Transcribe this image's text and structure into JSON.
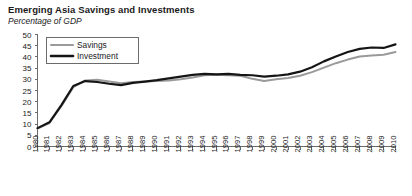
{
  "chart_data": {
    "type": "line",
    "title": "Emerging Asia Savings and Investments",
    "subtitle": "Percentage of GDP",
    "xlabel": "",
    "ylabel": "",
    "ylim": [
      0,
      50
    ],
    "ytick_step": 5,
    "grid": false,
    "legend_position": "top-left",
    "yticks": [
      0,
      5,
      10,
      15,
      20,
      25,
      30,
      35,
      40,
      45,
      50
    ],
    "ytick_labels": [
      "0",
      "5",
      "10",
      "15",
      "20",
      "25",
      "30",
      "35",
      "40",
      "45",
      "50"
    ],
    "x": [
      1980,
      1981,
      1982,
      1983,
      1984,
      1985,
      1986,
      1987,
      1988,
      1989,
      1990,
      1991,
      1992,
      1993,
      1994,
      1995,
      1996,
      1997,
      1998,
      1999,
      2000,
      2001,
      2002,
      2003,
      2004,
      2005,
      2006,
      2007,
      2008,
      2009,
      2010
    ],
    "xtick_labels": [
      "1980",
      "1981",
      "1982",
      "1983",
      "1984",
      "1985",
      "1986",
      "1987",
      "1988",
      "1989",
      "1990",
      "1991",
      "1992",
      "1993",
      "1994",
      "1995",
      "1996",
      "1997",
      "1998",
      "1999",
      "2000",
      "2001",
      "2002",
      "2003",
      "2004",
      "2005",
      "2006",
      "2007",
      "2008",
      "2009",
      "2010"
    ],
    "series": [
      {
        "name": "Savings",
        "color": "#9a9a9a",
        "values": [
          8.0,
          10.5,
          18.0,
          26.5,
          29.5,
          29.8,
          29.0,
          28.2,
          28.8,
          29.0,
          29.2,
          29.5,
          30.0,
          30.8,
          31.8,
          32.0,
          31.8,
          31.6,
          30.2,
          29.2,
          30.0,
          30.6,
          31.6,
          33.2,
          35.2,
          37.2,
          38.8,
          40.2,
          40.6,
          41.0,
          42.2
        ]
      },
      {
        "name": "Investment",
        "color": "#151515",
        "values": [
          8.2,
          10.8,
          18.5,
          27.0,
          29.2,
          28.8,
          28.0,
          27.4,
          28.4,
          29.0,
          29.6,
          30.4,
          31.2,
          32.0,
          32.4,
          32.2,
          32.4,
          32.0,
          31.8,
          31.2,
          31.6,
          32.2,
          33.4,
          35.4,
          38.0,
          40.2,
          42.2,
          43.6,
          44.2,
          44.0,
          45.6
        ]
      }
    ]
  },
  "legend": {
    "entries": [
      {
        "label": "Savings"
      },
      {
        "label": "Investment"
      }
    ]
  }
}
